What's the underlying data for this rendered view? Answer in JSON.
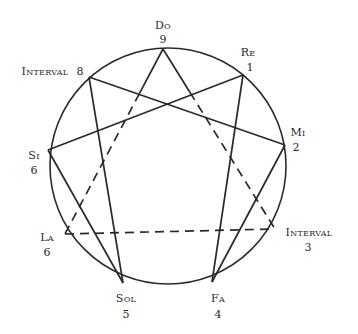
{
  "diagram": {
    "type": "enneagram",
    "colors": {
      "ink": "#2a2a2a",
      "background": "#ffffff"
    },
    "points": [
      {
        "id": "do",
        "name": "Do",
        "number": "9"
      },
      {
        "id": "re",
        "name": "Re",
        "number": "1"
      },
      {
        "id": "mi",
        "name": "Mi",
        "number": "2"
      },
      {
        "id": "int3",
        "name": "Interval",
        "number": "3"
      },
      {
        "id": "fa",
        "name": "Fa",
        "number": "4"
      },
      {
        "id": "sol",
        "name": "Sol",
        "number": "5"
      },
      {
        "id": "la",
        "name": "La",
        "number": "6"
      },
      {
        "id": "si",
        "name": "Si",
        "number": "6"
      },
      {
        "id": "int8",
        "name": "Interval",
        "number": "8"
      }
    ],
    "connections": [
      {
        "from": "int8",
        "to": "sol",
        "style": "solid"
      },
      {
        "from": "int8",
        "to": "mi",
        "style": "solid"
      },
      {
        "from": "si",
        "to": "re",
        "style": "solid"
      },
      {
        "from": "si",
        "to": "sol",
        "style": "solid"
      },
      {
        "from": "re",
        "to": "fa",
        "style": "solid"
      },
      {
        "from": "mi",
        "to": "fa",
        "style": "solid"
      },
      {
        "from": "do",
        "to": "la",
        "style": "solid-then-dashed"
      },
      {
        "from": "do",
        "to": "int3",
        "style": "solid-then-dashed"
      },
      {
        "from": "la",
        "to": "int3",
        "style": "dashed"
      }
    ]
  }
}
